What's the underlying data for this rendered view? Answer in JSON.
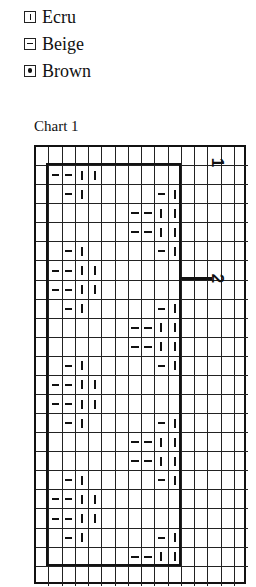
{
  "legend": {
    "items": [
      {
        "symbol": "bar",
        "icon": "vertical-bar-box-icon",
        "label": "Ecru"
      },
      {
        "symbol": "dash",
        "icon": "horizontal-dash-box-icon",
        "label": "Beige"
      },
      {
        "symbol": "dot",
        "icon": "dot-box-icon",
        "label": "Brown"
      }
    ]
  },
  "chart": {
    "title": "Chart 1",
    "columns": 16,
    "rows": 23,
    "inner_frame": {
      "col_start": 1,
      "col_end": 11,
      "row_start": 1,
      "row_end": 22
    },
    "section_labels": [
      {
        "text": "1",
        "row_line": 1
      },
      {
        "text": "2",
        "row_line": 7
      }
    ],
    "symbol_legend": {
      "|": "Ecru",
      "-": "Beige",
      "•": "Brown"
    },
    "grid_rows": [
      "................",
      ".--||...........",
      "..-|.....-|.....",
      ".......--||.....",
      ".......--||.....",
      "..-|.....-|.....",
      ".--||...........",
      ".--||...........",
      "..-|.....-|.....",
      ".......--||.....",
      ".......--||.....",
      "..-|.....-|.....",
      ".--||...........",
      ".--||...........",
      "..-|.....-|.....",
      ".......--||.....",
      ".......--||.....",
      "..-|.....-|.....",
      ".--||...........",
      ".--||...........",
      "..-|.....-|.....",
      ".......--||.....",
      "................"
    ]
  }
}
